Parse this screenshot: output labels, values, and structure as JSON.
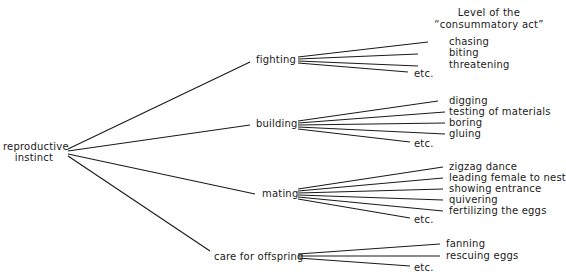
{
  "header": {
    "line1": "Level of the",
    "line2": "“consummatory act”"
  },
  "root": {
    "line1": "reproductive",
    "line2": "instinct"
  },
  "branches": [
    {
      "label": "fighting",
      "leaves": [
        "chasing",
        "biting",
        "threatening",
        "etc."
      ]
    },
    {
      "label": "building",
      "leaves": [
        "digging",
        "testing of materials",
        "boring",
        "gluing",
        "etc."
      ]
    },
    {
      "label": "mating",
      "leaves": [
        "zigzag dance",
        "leading female to nest",
        "showing entrance",
        "quivering",
        "fertilizing the eggs",
        "etc."
      ]
    },
    {
      "label": "care for offspring",
      "leaves": [
        "fanning",
        "rescuing eggs",
        "etc."
      ]
    }
  ],
  "colors": {
    "line": "#1a1a1a",
    "text": "#1a1a1a",
    "background": "#ffffff"
  }
}
